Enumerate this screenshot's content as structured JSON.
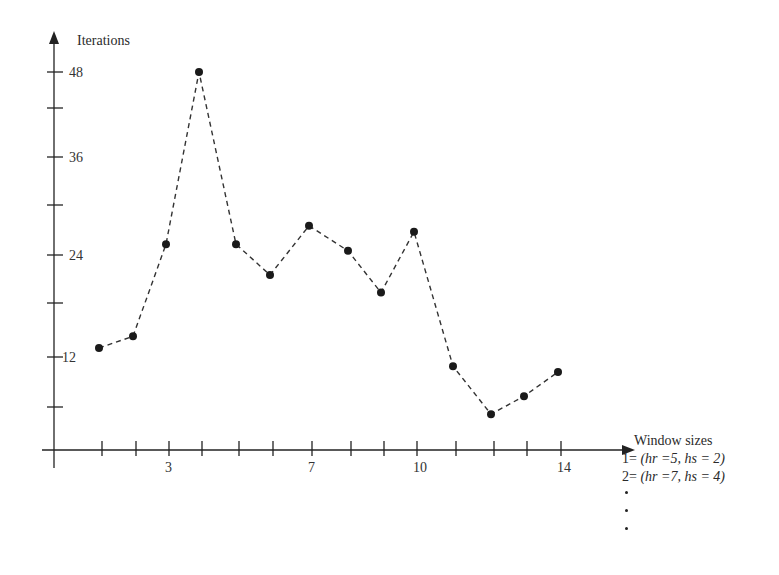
{
  "chart_data": {
    "type": "line",
    "title": "",
    "ylabel": "Iterations",
    "xlabel": "Window sizes",
    "x": [
      1,
      2,
      3,
      4,
      5,
      6,
      7,
      8,
      9,
      10,
      11,
      12,
      13,
      14
    ],
    "x_tick_labels": [
      {
        "x": 3,
        "label": "3"
      },
      {
        "x": 7,
        "label": "7"
      },
      {
        "x": 10,
        "label": "10"
      },
      {
        "x": 14,
        "label": "14"
      }
    ],
    "y_ticks": [
      6,
      12,
      18,
      24,
      30,
      36,
      42,
      48
    ],
    "y_tick_labels": [
      {
        "y": 12,
        "label": "12"
      },
      {
        "y": 24,
        "label": "24"
      },
      {
        "y": 36,
        "label": "36"
      },
      {
        "y": 48,
        "label": "48"
      }
    ],
    "series": [
      {
        "name": "Iterations",
        "style": "dashed line with filled circle markers",
        "values": [
          13,
          14.3,
          25.3,
          48,
          25.3,
          21.5,
          27.5,
          24.5,
          19.3,
          26.8,
          10.9,
          5,
          7.3,
          10.2
        ]
      }
    ],
    "ylim": [
      0,
      50
    ],
    "xlim": [
      0,
      16
    ],
    "grid": false,
    "legend_position": "bottom-right",
    "annotations": [
      "1= (hr =5, hs = 2)",
      "2= (hr =7, hs = 4)",
      "...",
      "..."
    ]
  },
  "axes": {
    "y_title": "Iterations",
    "x_title": "Window sizes"
  },
  "legend": {
    "title": "Window sizes",
    "entries": [
      {
        "prefix": "1= ",
        "text": "(hr =5, hs = 2)"
      },
      {
        "prefix": "2= ",
        "text": "(hr =7, hs = 4)"
      }
    ],
    "ellipsis_dots": 3
  },
  "colors": {
    "ink": "#222222",
    "line": "#333333",
    "background": "#ffffff"
  }
}
